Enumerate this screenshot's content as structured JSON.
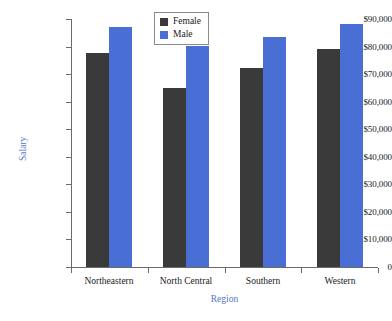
{
  "chart_data": {
    "type": "bar",
    "title": "",
    "subtitle": "",
    "xlabel": "Region",
    "ylabel": "Salary",
    "categories": [
      "Northeastern",
      "North Central",
      "Southern",
      "Western"
    ],
    "series": [
      {
        "name": "Female",
        "color": "#3a3a3a",
        "values": [
          77500,
          65000,
          72300,
          79000
        ]
      },
      {
        "name": "Male",
        "color": "#4a6fd4",
        "values": [
          87000,
          80300,
          83300,
          88200
        ]
      }
    ],
    "ylim": [
      0,
      90000
    ],
    "ytick_values": [
      0,
      10000,
      20000,
      30000,
      40000,
      50000,
      60000,
      70000,
      80000,
      90000
    ],
    "ytick_labels": [
      "0",
      "$10,000",
      "$20,000",
      "$30,000",
      "$40,000",
      "$50,000",
      "$60,000",
      "$70,000",
      "$80,000",
      "$90,000"
    ],
    "grid": false,
    "legend_position": "top-center",
    "legend_entries": [
      "Female",
      "Male"
    ],
    "axis_label_color": "#5577c8",
    "tick_label_color": "#1a1a1a",
    "axis_line_color": "#6b6b6b",
    "background_color": "#ffffff"
  },
  "layout": {
    "plot_left": 71,
    "plot_right": 378,
    "plot_top": 19,
    "plot_bottom": 267,
    "bar_width": 23,
    "group_gap": 0,
    "pair_gap": 0
  }
}
